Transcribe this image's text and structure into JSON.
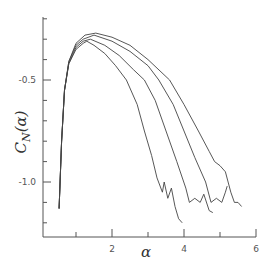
{
  "chart_data": {
    "type": "line",
    "title": "",
    "xlabel": "α",
    "ylabel": "C_N(α)",
    "ylabel_main": "C",
    "ylabel_sub": "N",
    "ylabel_arg": "(α)",
    "xlim": [
      0,
      6
    ],
    "ylim": [
      -1.27,
      -0.2
    ],
    "grid": false,
    "legend": null,
    "x_ticks": [
      0,
      1,
      2,
      3,
      4,
      5,
      6
    ],
    "x_tick_labels": [
      {
        "value": 2,
        "label": "2"
      },
      {
        "value": 4,
        "label": "4"
      },
      {
        "value": 6,
        "label": "6"
      }
    ],
    "y_ticks": [
      -0.2,
      -0.3,
      -0.4,
      -0.5,
      -0.6,
      -0.7,
      -0.8,
      -0.9,
      -1.0,
      -1.1,
      -1.2
    ],
    "y_tick_labels": [
      {
        "value": -0.5,
        "label": "-0.5"
      },
      {
        "value": -1.0,
        "label": "-1.0"
      }
    ],
    "series": [
      {
        "name": "curve-1",
        "points": [
          [
            0.53,
            -1.13
          ],
          [
            0.6,
            -0.8
          ],
          [
            0.68,
            -0.55
          ],
          [
            0.8,
            -0.42
          ],
          [
            1.0,
            -0.35
          ],
          [
            1.2,
            -0.32
          ],
          [
            1.3,
            -0.31
          ],
          [
            1.5,
            -0.33
          ],
          [
            1.8,
            -0.37
          ],
          [
            2.1,
            -0.43
          ],
          [
            2.4,
            -0.5
          ],
          [
            2.7,
            -0.62
          ],
          [
            2.9,
            -0.75
          ],
          [
            3.1,
            -0.87
          ],
          [
            3.25,
            -0.98
          ],
          [
            3.4,
            -1.05
          ],
          [
            3.45,
            -1.0
          ],
          [
            3.55,
            -1.08
          ],
          [
            3.65,
            -1.03
          ],
          [
            3.75,
            -1.12
          ],
          [
            3.85,
            -1.18
          ],
          [
            3.95,
            -1.2
          ]
        ]
      },
      {
        "name": "curve-2",
        "points": [
          [
            0.53,
            -1.13
          ],
          [
            0.6,
            -0.8
          ],
          [
            0.68,
            -0.55
          ],
          [
            0.8,
            -0.42
          ],
          [
            1.0,
            -0.34
          ],
          [
            1.2,
            -0.31
          ],
          [
            1.4,
            -0.3
          ],
          [
            1.8,
            -0.33
          ],
          [
            2.2,
            -0.38
          ],
          [
            2.6,
            -0.45
          ],
          [
            2.9,
            -0.5
          ],
          [
            3.2,
            -0.6
          ],
          [
            3.5,
            -0.75
          ],
          [
            3.8,
            -0.9
          ],
          [
            4.05,
            -1.03
          ],
          [
            4.15,
            -1.1
          ],
          [
            4.3,
            -1.08
          ],
          [
            4.45,
            -1.1
          ],
          [
            4.55,
            -1.06
          ],
          [
            4.7,
            -1.14
          ],
          [
            4.8,
            -1.15
          ]
        ]
      },
      {
        "name": "curve-3",
        "points": [
          [
            0.53,
            -1.13
          ],
          [
            0.6,
            -0.8
          ],
          [
            0.68,
            -0.55
          ],
          [
            0.8,
            -0.41
          ],
          [
            1.0,
            -0.33
          ],
          [
            1.2,
            -0.3
          ],
          [
            1.5,
            -0.28
          ],
          [
            2.0,
            -0.31
          ],
          [
            2.5,
            -0.36
          ],
          [
            3.0,
            -0.43
          ],
          [
            3.3,
            -0.5
          ],
          [
            3.7,
            -0.62
          ],
          [
            4.0,
            -0.75
          ],
          [
            4.3,
            -0.88
          ],
          [
            4.6,
            -1.0
          ],
          [
            4.75,
            -1.1
          ],
          [
            4.9,
            -1.08
          ],
          [
            5.05,
            -1.1
          ],
          [
            5.15,
            -1.05
          ],
          [
            5.2,
            -1.02
          ]
        ]
      },
      {
        "name": "curve-4",
        "points": [
          [
            0.53,
            -1.13
          ],
          [
            0.6,
            -0.8
          ],
          [
            0.68,
            -0.55
          ],
          [
            0.8,
            -0.41
          ],
          [
            1.0,
            -0.32
          ],
          [
            1.25,
            -0.28
          ],
          [
            1.55,
            -0.27
          ],
          [
            2.0,
            -0.29
          ],
          [
            2.5,
            -0.33
          ],
          [
            3.0,
            -0.4
          ],
          [
            3.6,
            -0.5
          ],
          [
            4.0,
            -0.62
          ],
          [
            4.4,
            -0.75
          ],
          [
            4.7,
            -0.85
          ],
          [
            4.85,
            -0.9
          ],
          [
            5.0,
            -0.92
          ],
          [
            5.15,
            -0.95
          ],
          [
            5.3,
            -1.05
          ],
          [
            5.4,
            -1.1
          ],
          [
            5.5,
            -1.1
          ],
          [
            5.6,
            -1.12
          ]
        ]
      }
    ],
    "line_color": "#444444",
    "axis_color": "#555555"
  }
}
